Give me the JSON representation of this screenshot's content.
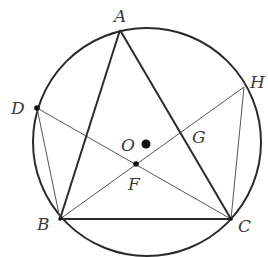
{
  "figure": {
    "type": "geometry",
    "circle": {
      "name": "O",
      "cx": 147,
      "cy": 142,
      "r": 114
    },
    "center_dot": {
      "label": "O",
      "x": 146,
      "y": 144
    },
    "points": [
      {
        "label": "A",
        "x": 120,
        "y": 30,
        "label_x": 114,
        "label_y": 22
      },
      {
        "label": "B",
        "x": 60,
        "y": 219,
        "label_x": 37,
        "label_y": 230
      },
      {
        "label": "C",
        "x": 231,
        "y": 219,
        "label_x": 238,
        "label_y": 232
      },
      {
        "label": "D",
        "x": 37,
        "y": 108,
        "label_x": 11,
        "label_y": 114
      },
      {
        "label": "H",
        "x": 244,
        "y": 87,
        "label_x": 250,
        "label_y": 88
      },
      {
        "label": "F",
        "x": 136,
        "y": 164,
        "label_x": 128,
        "label_y": 190
      },
      {
        "label": "G",
        "x": 181,
        "y": 132,
        "label_x": 192,
        "label_y": 143
      },
      {
        "label": "O",
        "x": 146,
        "y": 144,
        "label_x": 121,
        "label_y": 151
      }
    ],
    "segments_thick": [
      [
        "A",
        "B"
      ],
      [
        "A",
        "C"
      ],
      [
        "B",
        "C"
      ]
    ],
    "segments_thin": [
      [
        "D",
        "C"
      ],
      [
        "B",
        "H"
      ],
      [
        "D",
        "B"
      ],
      [
        "H",
        "C"
      ]
    ],
    "colors": {
      "stroke": "#2b2b2b",
      "thin_stroke": "#555555",
      "label": "#3a3a3a"
    }
  }
}
